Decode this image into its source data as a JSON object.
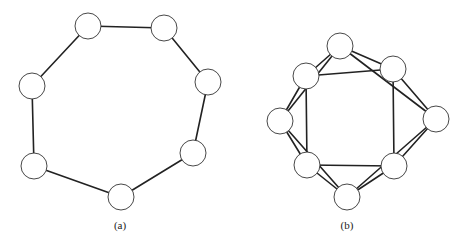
{
  "figure": {
    "panels": [
      {
        "id": "a",
        "caption": "(a)",
        "caption_pos": [
          120,
          229
        ],
        "node_radius": 13,
        "nodes": [
          {
            "id": "n0",
            "x": 88,
            "y": 26
          },
          {
            "id": "n1",
            "x": 164,
            "y": 28
          },
          {
            "id": "n2",
            "x": 208,
            "y": 82
          },
          {
            "id": "n3",
            "x": 193,
            "y": 153
          },
          {
            "id": "n4",
            "x": 121,
            "y": 197
          },
          {
            "id": "n5",
            "x": 34,
            "y": 166
          },
          {
            "id": "n6",
            "x": 32,
            "y": 86
          }
        ],
        "edges": [
          [
            0,
            1
          ],
          [
            1,
            2
          ],
          [
            2,
            3
          ],
          [
            3,
            4
          ],
          [
            4,
            5
          ],
          [
            5,
            6
          ],
          [
            6,
            0
          ]
        ]
      },
      {
        "id": "b",
        "caption": "(b)",
        "caption_pos": [
          347,
          229
        ],
        "node_radius": 13,
        "nodes": [
          {
            "id": "m0",
            "x": 340,
            "y": 46
          },
          {
            "id": "m1",
            "x": 393,
            "y": 69
          },
          {
            "id": "m2",
            "x": 436,
            "y": 119
          },
          {
            "id": "m3",
            "x": 394,
            "y": 166
          },
          {
            "id": "m4",
            "x": 347,
            "y": 197
          },
          {
            "id": "m5",
            "x": 307,
            "y": 165
          },
          {
            "id": "m6",
            "x": 280,
            "y": 121
          },
          {
            "id": "m7",
            "x": 306,
            "y": 76
          }
        ],
        "edges": [
          [
            0,
            1
          ],
          [
            1,
            2
          ],
          [
            2,
            3
          ],
          [
            3,
            4
          ],
          [
            4,
            5
          ],
          [
            5,
            6
          ],
          [
            6,
            7
          ],
          [
            7,
            0
          ],
          [
            0,
            2
          ],
          [
            1,
            3
          ],
          [
            2,
            4
          ],
          [
            3,
            5
          ],
          [
            4,
            6
          ],
          [
            5,
            7
          ],
          [
            6,
            0
          ],
          [
            7,
            1
          ]
        ]
      }
    ]
  }
}
